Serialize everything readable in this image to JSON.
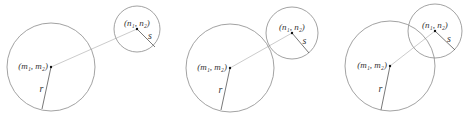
{
  "figure": {
    "colors": {
      "circle": "#8a8a8a",
      "radius": "#555555",
      "center_line": "#cccccc",
      "dot": "#111111"
    },
    "panels": [
      {
        "id": "separate",
        "big": {
          "cx": 51,
          "cy": 67,
          "r": 44,
          "label": "(m₁, m₂)",
          "radius_label": "r",
          "radius_end": [
            42,
            109
          ]
        },
        "small": {
          "cx": 137,
          "cy": 29,
          "r": 23,
          "label": "(n₁, n₂)",
          "radius_label": "s",
          "radius_end": [
            155,
            47
          ]
        }
      },
      {
        "id": "tangent",
        "big": {
          "cx": 230,
          "cy": 68,
          "r": 44,
          "label": "(m₁, m₂)",
          "radius_label": "r",
          "radius_end": [
            221,
            110
          ]
        },
        "small": {
          "cx": 292,
          "cy": 33,
          "r": 26,
          "label": "(n₁, n₂)",
          "radius_label": "s",
          "radius_end": [
            309,
            53
          ]
        }
      },
      {
        "id": "overlapping",
        "big": {
          "cx": 390,
          "cy": 66,
          "r": 45,
          "label": "(m₁, m₂)",
          "radius_label": "r",
          "radius_end": [
            381,
            110
          ]
        },
        "small": {
          "cx": 435,
          "cy": 31,
          "r": 27,
          "label": "(n₁, n₂)",
          "radius_label": "s",
          "radius_end": [
            455,
            50
          ]
        }
      }
    ]
  }
}
